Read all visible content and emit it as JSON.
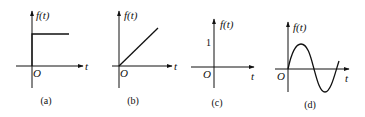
{
  "figure": {
    "panels": [
      {
        "id": "a",
        "caption": "(a)",
        "y_label": "f(t)",
        "x_label": "t",
        "origin_label": "O",
        "signal": "step"
      },
      {
        "id": "b",
        "caption": "(b)",
        "y_label": "f(t)",
        "x_label": "t",
        "origin_label": "O",
        "signal": "ramp"
      },
      {
        "id": "c",
        "caption": "(c)",
        "y_label": "f(t)",
        "x_label": "t",
        "origin_label": "O",
        "tick_label": "1",
        "signal": "none"
      },
      {
        "id": "d",
        "caption": "(d)",
        "y_label": "f(t)",
        "x_label": "t",
        "origin_label": "O",
        "signal": "sine"
      }
    ]
  },
  "colors": {
    "ink": "#111111",
    "background": "#ffffff"
  }
}
